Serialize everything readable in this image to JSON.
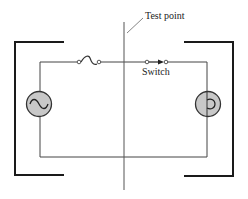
{
  "diagram": {
    "labels": {
      "test_point": "Test point",
      "switch": "Switch"
    },
    "components": [
      {
        "type": "ac-source",
        "icon": "sine-wave-icon",
        "position": "left"
      },
      {
        "type": "fuse",
        "icon": "fuse-icon",
        "position": "top-left"
      },
      {
        "type": "switch",
        "icon": "switch-arrow-icon",
        "position": "top-right"
      },
      {
        "type": "lamp",
        "icon": "lamp-filament-icon",
        "position": "right"
      }
    ],
    "colors": {
      "line": "#333333",
      "bracket": "#1a1a1a",
      "component_fill": "#c8c8c8"
    }
  }
}
